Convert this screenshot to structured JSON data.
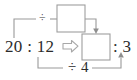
{
  "diagram": {
    "type": "ratio-simplification",
    "expression": {
      "left_ratio": "20 : 12",
      "arrow": "⇒",
      "right_ratio_tail": ": 3"
    },
    "operations": {
      "top_label": "÷",
      "bottom_label": "÷ 4"
    },
    "boxes": {
      "top_box_value": "",
      "answer_box_value": ""
    },
    "colors": {
      "line": "#9a9a9a",
      "box_border": "#9e9e9e",
      "text": "#2b2b2b",
      "arrow_outline": "#a8a8a8",
      "background": "#ffffff"
    }
  }
}
